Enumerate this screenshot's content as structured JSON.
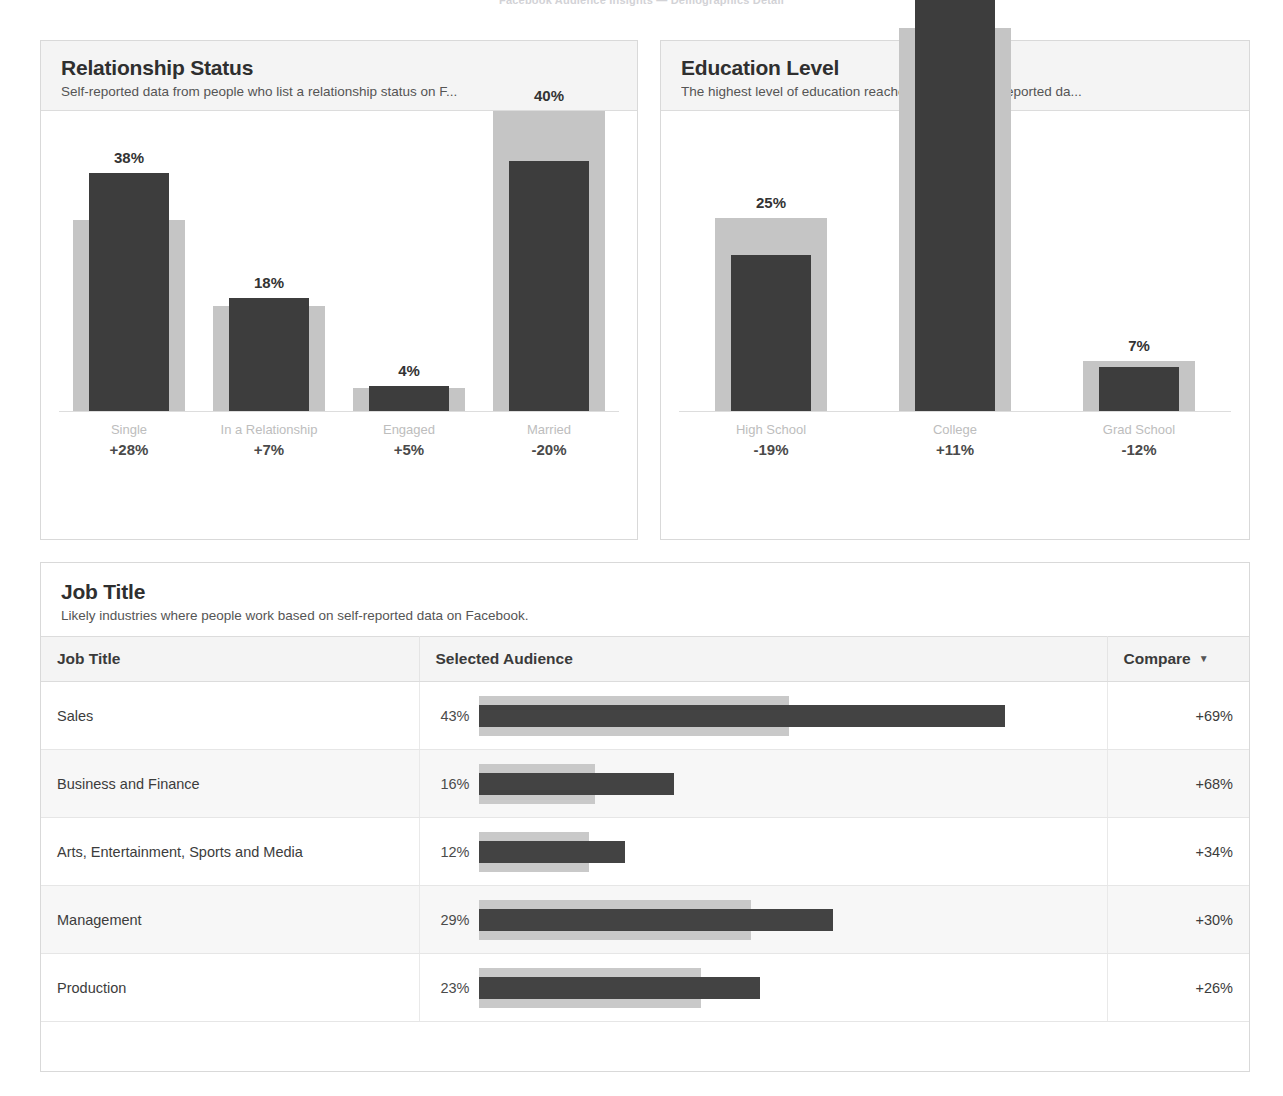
{
  "top_header": {
    "text": "Facebook Audience Insights — Demographics Detail"
  },
  "colors": {
    "audience_bar": "#3d3d3d",
    "compare_bar": "#c5c5c5",
    "panel_header_bg": "#f4f4f4",
    "panel_border": "#d9d9d9",
    "compare_text": "#8e8e8e"
  },
  "panels": {
    "relationship": {
      "title": "Relationship Status",
      "subtitle": "Self-reported data from people who list a relationship status on F..."
    },
    "education": {
      "title": "Education Level",
      "subtitle": "The highest level of education reached based on self-reported da..."
    },
    "jobtitle": {
      "title": "Job Title",
      "subtitle": "Likely industries where people work based on self-reported data on Facebook."
    }
  },
  "table": {
    "headers": {
      "job_title": "Job Title",
      "selected_audience": "Selected Audience",
      "compare": "Compare",
      "sort_caret": "▼"
    }
  },
  "chart_data": [
    {
      "type": "bar",
      "title": "Relationship Status",
      "subtitle": "Self-reported data from people who list a relationship status on F...",
      "xlabel": "",
      "ylabel": "",
      "ylim": [
        0,
        48
      ],
      "grid": false,
      "legend": "none",
      "categories": [
        "Single",
        "In a Relationship",
        "Engaged",
        "Married"
      ],
      "value_labels": [
        "38%",
        "18%",
        "4%",
        "40%"
      ],
      "compare_labels": [
        "+28%",
        "+7%",
        "+5%",
        "-20%"
      ],
      "series": [
        {
          "name": "Selected Audience",
          "values": [
            38,
            18,
            4,
            40
          ]
        },
        {
          "name": "Compare",
          "values": [
            30.5,
            16.8,
            3.6,
            48.0
          ]
        }
      ]
    },
    {
      "type": "bar",
      "title": "Education Level",
      "subtitle": "The highest level of education reached based on self-reported da...",
      "xlabel": "",
      "ylabel": "",
      "ylim": [
        0,
        48
      ],
      "grid": false,
      "legend": "none",
      "categories": [
        "High School",
        "College",
        "Grad School"
      ],
      "value_labels": [
        "25%",
        "68%",
        "7%"
      ],
      "compare_labels": [
        "-19%",
        "+11%",
        "-12%"
      ],
      "series": [
        {
          "name": "Selected Audience",
          "values": [
            25,
            68,
            7
          ]
        },
        {
          "name": "Compare",
          "values": [
            30.9,
            61.3,
            8.0
          ]
        }
      ]
    },
    {
      "type": "bar",
      "title": "Job Title",
      "subtitle": "Likely industries where people work based on self-reported data on Facebook.",
      "orientation": "horizontal",
      "xlabel": "",
      "ylabel": "",
      "xlim": [
        0,
        50
      ],
      "grid": false,
      "legend": "none",
      "categories": [
        "Sales",
        "Business and Finance",
        "Arts, Entertainment, Sports and Media",
        "Management",
        "Production"
      ],
      "value_labels": [
        "43%",
        "16%",
        "12%",
        "29%",
        "23%"
      ],
      "compare_labels": [
        "+69%",
        "+68%",
        "+34%",
        "+30%",
        "+26%"
      ],
      "series": [
        {
          "name": "Selected Audience",
          "values": [
            43,
            16,
            12,
            29,
            23
          ]
        },
        {
          "name": "Compare",
          "values": [
            25.4,
            9.5,
            9.0,
            22.3,
            18.2
          ]
        }
      ]
    }
  ],
  "table_rows": [
    {
      "job_title": "Sales",
      "pct": "43%",
      "compare": "+69%",
      "audience": 43,
      "benchmark": 25.4
    },
    {
      "job_title": "Business and Finance",
      "pct": "16%",
      "compare": "+68%",
      "audience": 16,
      "benchmark": 9.5
    },
    {
      "job_title": "Arts, Entertainment, Sports and Media",
      "pct": "12%",
      "compare": "+34%",
      "audience": 12,
      "benchmark": 9.0
    },
    {
      "job_title": "Management",
      "pct": "29%",
      "compare": "+30%",
      "audience": 29,
      "benchmark": 22.3
    },
    {
      "job_title": "Production",
      "pct": "23%",
      "compare": "+26%",
      "audience": 23,
      "benchmark": 18.2
    }
  ]
}
